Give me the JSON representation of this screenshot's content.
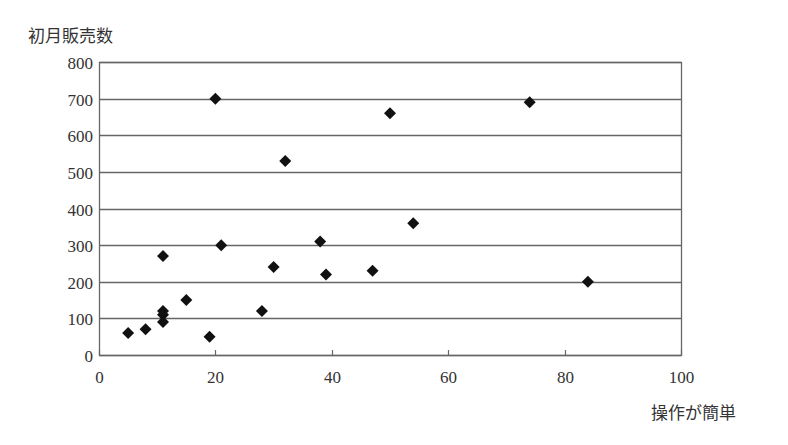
{
  "chart_data": {
    "type": "scatter",
    "title": "",
    "xlabel": "操作が簡単",
    "ylabel": "初月販売数",
    "xlim": [
      0,
      100
    ],
    "ylim": [
      0,
      800
    ],
    "xticks": [
      0,
      20,
      40,
      60,
      80,
      100
    ],
    "yticks": [
      0,
      100,
      200,
      300,
      400,
      500,
      600,
      700,
      800
    ],
    "grid": {
      "horizontal": true,
      "vertical": false
    },
    "legend": null,
    "marker": "diamond",
    "marker_color": "#111111",
    "series": [
      {
        "name": "",
        "points": [
          {
            "x": 5,
            "y": 60
          },
          {
            "x": 8,
            "y": 70
          },
          {
            "x": 11,
            "y": 120
          },
          {
            "x": 11,
            "y": 110
          },
          {
            "x": 11,
            "y": 90
          },
          {
            "x": 11,
            "y": 270
          },
          {
            "x": 15,
            "y": 150
          },
          {
            "x": 19,
            "y": 50
          },
          {
            "x": 20,
            "y": 700
          },
          {
            "x": 21,
            "y": 300
          },
          {
            "x": 28,
            "y": 120
          },
          {
            "x": 30,
            "y": 240
          },
          {
            "x": 32,
            "y": 530
          },
          {
            "x": 38,
            "y": 310
          },
          {
            "x": 39,
            "y": 220
          },
          {
            "x": 47,
            "y": 230
          },
          {
            "x": 50,
            "y": 660
          },
          {
            "x": 54,
            "y": 360
          },
          {
            "x": 74,
            "y": 690
          },
          {
            "x": 84,
            "y": 200
          }
        ]
      }
    ]
  },
  "labels": {
    "y_axis_title": "初月販売数",
    "x_axis_title": "操作が簡単"
  }
}
